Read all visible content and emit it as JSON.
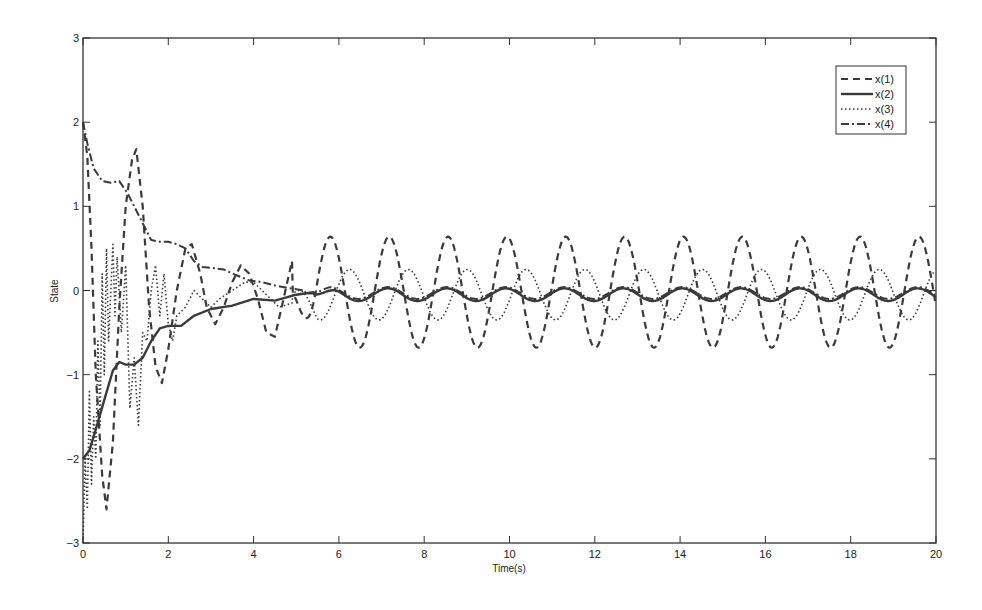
{
  "chart_data": {
    "type": "line",
    "title": "",
    "xlabel": "Time(s)",
    "ylabel": "State",
    "xlim": [
      0,
      20
    ],
    "ylim": [
      -3,
      3
    ],
    "xticks": [
      0,
      2,
      4,
      6,
      8,
      10,
      12,
      14,
      16,
      18,
      20
    ],
    "yticks": [
      -3,
      -2,
      -1,
      0,
      1,
      2,
      3
    ],
    "grid": false,
    "legend_position": "upper-right",
    "legend": [
      "x(1)",
      "x(2)",
      "x(3)",
      "x(4)"
    ],
    "series": [
      {
        "name": "x(1)",
        "style": "dashed",
        "transient": [
          [
            0,
            2.0
          ],
          [
            0.1,
            1.6
          ],
          [
            0.2,
            0.5
          ],
          [
            0.3,
            -1.0
          ],
          [
            0.45,
            -2.2
          ],
          [
            0.55,
            -2.6
          ],
          [
            0.7,
            -1.8
          ],
          [
            0.85,
            -0.2
          ],
          [
            1.0,
            1.0
          ],
          [
            1.15,
            1.55
          ],
          [
            1.25,
            1.68
          ],
          [
            1.4,
            1.0
          ],
          [
            1.55,
            -0.2
          ],
          [
            1.7,
            -0.9
          ],
          [
            1.85,
            -1.1
          ],
          [
            2.0,
            -0.7
          ],
          [
            2.2,
            0.0
          ],
          [
            2.4,
            0.5
          ],
          [
            2.55,
            0.55
          ],
          [
            2.75,
            0.2
          ],
          [
            2.9,
            -0.2
          ],
          [
            3.1,
            -0.4
          ],
          [
            3.3,
            -0.2
          ],
          [
            3.5,
            0.1
          ],
          [
            3.7,
            0.3
          ],
          [
            3.9,
            0.2
          ],
          [
            4.1,
            -0.1
          ],
          [
            4.3,
            -0.5
          ],
          [
            4.5,
            -0.55
          ],
          [
            4.7,
            -0.1
          ],
          [
            4.9,
            0.35
          ]
        ],
        "steady": {
          "amplitude": 0.66,
          "period": 1.38,
          "phase_t": 5.8,
          "offset": -0.02,
          "from": 4.9
        }
      },
      {
        "name": "x(2)",
        "style": "solid",
        "transient": [
          [
            0,
            -2.0
          ],
          [
            0.15,
            -1.9
          ],
          [
            0.3,
            -1.65
          ],
          [
            0.5,
            -1.3
          ],
          [
            0.7,
            -0.95
          ],
          [
            0.85,
            -0.85
          ],
          [
            1.0,
            -0.88
          ],
          [
            1.2,
            -0.88
          ],
          [
            1.4,
            -0.8
          ],
          [
            1.6,
            -0.6
          ],
          [
            1.8,
            -0.45
          ],
          [
            2.0,
            -0.42
          ],
          [
            2.3,
            -0.42
          ],
          [
            2.6,
            -0.3
          ],
          [
            3.0,
            -0.22
          ],
          [
            3.5,
            -0.18
          ],
          [
            4.0,
            -0.1
          ],
          [
            4.5,
            -0.12
          ],
          [
            5.0,
            -0.05
          ],
          [
            5.4,
            -0.02
          ]
        ],
        "steady": {
          "amplitude": 0.075,
          "period": 1.38,
          "phase_t": 7.15,
          "offset": -0.05,
          "from": 5.4
        }
      },
      {
        "name": "x(3)",
        "style": "dotted",
        "transient": [
          [
            0,
            -3.0
          ],
          [
            0.05,
            -2.0
          ],
          [
            0.1,
            -2.6
          ],
          [
            0.15,
            -1.2
          ],
          [
            0.2,
            -2.3
          ],
          [
            0.25,
            -1.5
          ],
          [
            0.3,
            -2.0
          ],
          [
            0.35,
            -0.6
          ],
          [
            0.4,
            -1.6
          ],
          [
            0.45,
            0.2
          ],
          [
            0.5,
            -1.0
          ],
          [
            0.55,
            0.5
          ],
          [
            0.6,
            -0.6
          ],
          [
            0.7,
            0.55
          ],
          [
            0.75,
            -0.3
          ],
          [
            0.8,
            0.4
          ],
          [
            0.9,
            -0.5
          ],
          [
            1.0,
            0.3
          ],
          [
            1.1,
            -1.4
          ],
          [
            1.2,
            -0.8
          ],
          [
            1.3,
            -1.6
          ],
          [
            1.4,
            -0.5
          ],
          [
            1.5,
            -0.6
          ],
          [
            1.6,
            0.0
          ],
          [
            1.7,
            0.3
          ],
          [
            1.8,
            -0.3
          ],
          [
            1.9,
            0.2
          ],
          [
            2.0,
            -0.4
          ],
          [
            2.1,
            -0.6
          ],
          [
            2.2,
            -0.3
          ],
          [
            2.4,
            -0.2
          ],
          [
            2.6,
            0.0
          ],
          [
            2.8,
            -0.1
          ],
          [
            3.0,
            -0.2
          ],
          [
            3.2,
            -0.1
          ],
          [
            3.5,
            0.0
          ],
          [
            3.8,
            0.1
          ],
          [
            4.0,
            0.1
          ],
          [
            4.3,
            -0.05
          ],
          [
            4.6,
            -0.2
          ],
          [
            4.9,
            -0.15
          ]
        ],
        "steady": {
          "amplitude": 0.3,
          "period": 1.38,
          "phase_t": 6.25,
          "offset": -0.05,
          "from": 4.9
        }
      },
      {
        "name": "x(4)",
        "style": "dashdot",
        "transient": [
          [
            0,
            2.0
          ],
          [
            0.1,
            1.75
          ],
          [
            0.25,
            1.45
          ],
          [
            0.45,
            1.3
          ],
          [
            0.65,
            1.28
          ],
          [
            0.85,
            1.3
          ],
          [
            1.05,
            1.15
          ],
          [
            1.25,
            0.95
          ],
          [
            1.4,
            0.8
          ],
          [
            1.6,
            0.6
          ],
          [
            1.8,
            0.58
          ],
          [
            2.0,
            0.58
          ],
          [
            2.2,
            0.55
          ],
          [
            2.4,
            0.5
          ],
          [
            2.6,
            0.35
          ],
          [
            2.8,
            0.28
          ],
          [
            3.0,
            0.27
          ],
          [
            3.3,
            0.25
          ],
          [
            3.6,
            0.18
          ],
          [
            3.9,
            0.12
          ],
          [
            4.2,
            0.1
          ],
          [
            4.5,
            0.06
          ],
          [
            4.8,
            0.03
          ],
          [
            5.2,
            0.0
          ]
        ],
        "steady": {
          "amplitude": 0.07,
          "period": 1.38,
          "phase_t": 7.15,
          "offset": -0.03,
          "from": 5.2
        }
      }
    ]
  },
  "axes": {
    "xlabel": "Time(s)",
    "ylabel": "State",
    "xtick_labels": [
      "0",
      "2",
      "4",
      "6",
      "8",
      "10",
      "12",
      "14",
      "16",
      "18",
      "20"
    ],
    "ytick_labels": [
      "-3",
      "-2",
      "-1",
      "0",
      "1",
      "2",
      "3"
    ]
  },
  "legend": {
    "items": [
      "x(1)",
      "x(2)",
      "x(3)",
      "x(4)"
    ]
  },
  "colors": {
    "line": "#3a3a3a",
    "axis": "#333333",
    "background": "#ffffff"
  }
}
